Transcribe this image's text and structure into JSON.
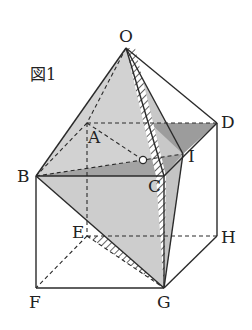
{
  "figure": {
    "title": "図1",
    "labels": {
      "O": "O",
      "A": "A",
      "B": "B",
      "C": "C",
      "D": "D",
      "E": "E",
      "F": "F",
      "G": "G",
      "H": "H",
      "I": "I"
    }
  },
  "colors": {
    "line": "#2a2a2a",
    "light_face": "#cfcfcf",
    "dark_face": "#9a9a9a",
    "hatch": "#3a3a3a"
  }
}
